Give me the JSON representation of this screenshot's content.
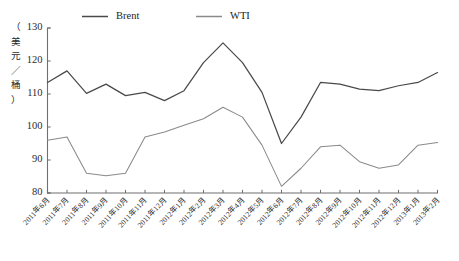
{
  "chart_data": {
    "type": "line",
    "title": "",
    "xlabel": "",
    "ylabel": "（美元／桶）",
    "ylim": [
      80,
      130
    ],
    "yticks": [
      80,
      90,
      100,
      110,
      120,
      130
    ],
    "grid": false,
    "legend_position": "top-center",
    "categories": [
      "2011年6月",
      "2011年7月",
      "2011年8月",
      "2011年9月",
      "2011年10月",
      "2011年11月",
      "2011年12月",
      "2012年1月",
      "2012年2月",
      "2012年3月",
      "2012年4月",
      "2012年5月",
      "2012年6月",
      "2012年7月",
      "2012年8月",
      "2012年9月",
      "2012年10月",
      "2012年11月",
      "2012年12月",
      "2013年1月",
      "2013年2月"
    ],
    "series": [
      {
        "name": "Brent",
        "color": "#4a4a4a",
        "values": [
          113.5,
          117.0,
          110.2,
          113.0,
          109.5,
          110.5,
          108.0,
          111.0,
          119.5,
          125.5,
          119.5,
          110.5,
          95.0,
          103.0,
          113.5,
          113.0,
          111.5,
          111.0,
          112.5,
          113.5,
          116.5
        ]
      },
      {
        "name": "WTI",
        "color": "#8a8a8a",
        "values": [
          96.0,
          97.0,
          86.0,
          85.2,
          86.0,
          97.0,
          98.5,
          100.5,
          102.5,
          106.0,
          103.0,
          94.5,
          82.0,
          87.5,
          94.0,
          94.5,
          89.5,
          87.5,
          88.5,
          94.5,
          95.3
        ]
      }
    ]
  },
  "legend": {
    "items": [
      {
        "label": "Brent",
        "color": "#4a4a4a"
      },
      {
        "label": "WTI",
        "color": "#8a8a8a"
      }
    ]
  },
  "axes": {
    "y_axis_title": "（美元／桶）",
    "y_tick_labels": [
      "130",
      "120",
      "110",
      "100",
      "90",
      "80"
    ]
  }
}
